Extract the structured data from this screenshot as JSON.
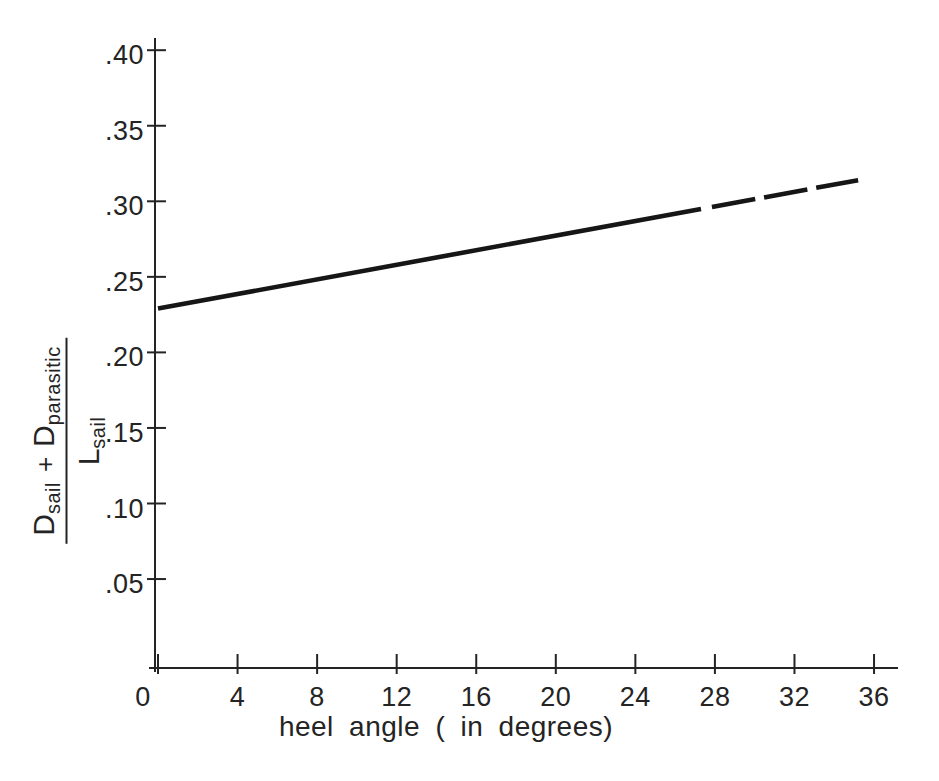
{
  "figure": {
    "background": "#ffffff",
    "ink_color": "#242424",
    "line_color": "#161616"
  },
  "chart_data": {
    "type": "line",
    "title": "",
    "xlabel": "heel angle ( in degrees)",
    "ylabel_text": "(D_sail + D_parasitic) / L_sail",
    "ylabel_fraction": {
      "numerator": [
        {
          "base": "D",
          "sub": "sail"
        },
        {
          "base": "+",
          "sub": ""
        },
        {
          "base": "D",
          "sub": "parasitic"
        }
      ],
      "denominator": {
        "base": "L",
        "sub": "sail"
      }
    },
    "x_ticks": [
      {
        "value": 0,
        "label": "0"
      },
      {
        "value": 4,
        "label": "4"
      },
      {
        "value": 8,
        "label": "8"
      },
      {
        "value": 12,
        "label": "12"
      },
      {
        "value": 16,
        "label": "16"
      },
      {
        "value": 20,
        "label": "20"
      },
      {
        "value": 24,
        "label": "24"
      },
      {
        "value": 28,
        "label": "28"
      },
      {
        "value": 32,
        "label": "32"
      },
      {
        "value": 36,
        "label": "36"
      }
    ],
    "y_ticks": [
      {
        "value": 0.05,
        "label": ".05"
      },
      {
        "value": 0.1,
        "label": ".10"
      },
      {
        "value": 0.15,
        "label": ".15"
      },
      {
        "value": 0.2,
        "label": ".20"
      },
      {
        "value": 0.25,
        "label": ".25"
      },
      {
        "value": 0.3,
        "label": ".30"
      },
      {
        "value": 0.35,
        "label": ".35"
      },
      {
        "value": 0.4,
        "label": ".40"
      }
    ],
    "xlim": [
      0,
      37.2
    ],
    "ylim": [
      0,
      0.408
    ],
    "grid": false,
    "legend": null,
    "series": [
      {
        "name": "sail drag-to-lift ratio vs heel angle",
        "x": [
          0,
          35.2
        ],
        "y": [
          0.229,
          0.314
        ],
        "solid_until_x": 27.3,
        "dashed_from_x": 27.85,
        "dash_px": [
          44,
          9
        ],
        "width_px": 4.6
      }
    ]
  }
}
